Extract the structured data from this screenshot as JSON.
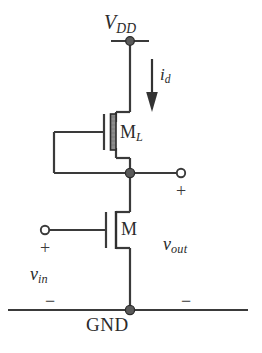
{
  "figure": {
    "kind": "circuit-schematic",
    "background_color": "#ffffff",
    "wire_color": "#3a3a3a",
    "node_color": "#555555",
    "channel_shade_color": "#8a8a8a"
  },
  "labels": {
    "supply": {
      "base": "V",
      "sub": "DD"
    },
    "current": {
      "base": "i",
      "sub": "d"
    },
    "load_transistor": {
      "base": "M",
      "sub": "L"
    },
    "drive_transistor": {
      "base": "M",
      "sub": ""
    },
    "input_voltage": {
      "base": "v",
      "sub": "in"
    },
    "output_voltage": {
      "base": "v",
      "sub": "out"
    },
    "ground": "GND"
  },
  "polarity_marks": {
    "output_plus": "+",
    "output_minus": "−",
    "input_plus": "+",
    "input_minus": "−"
  },
  "terminals": [
    {
      "name": "output-terminal",
      "type": "open-circle",
      "x": 181,
      "y": 172
    },
    {
      "name": "input-terminal",
      "type": "open-circle",
      "x": 45,
      "y": 224
    }
  ],
  "nodes": [
    {
      "name": "vdd-node",
      "type": "filled-dot",
      "x": 130,
      "y": 41
    },
    {
      "name": "output-node",
      "type": "filled-dot",
      "x": 130,
      "y": 173
    },
    {
      "name": "gnd-node",
      "type": "filled-dot",
      "x": 130,
      "y": 310
    }
  ],
  "rails": [
    {
      "name": "vdd-rail",
      "x1": 111,
      "x2": 149,
      "y": 41
    },
    {
      "name": "gnd-rail",
      "x1": 8,
      "x2": 248,
      "y": 310
    }
  ],
  "current_arrow": {
    "name": "drain-current-arrow",
    "x": 152,
    "y1": 59,
    "y2": 110,
    "direction": "down"
  }
}
